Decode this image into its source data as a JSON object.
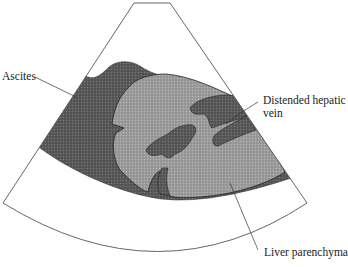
{
  "figure": {
    "type": "ultrasound-sector-schematic",
    "labels": {
      "ascites": "Ascites",
      "hepatic_vein_line1": "Distended hepatic",
      "hepatic_vein_line2": "vein",
      "liver": "Liver parenchyma"
    },
    "colors": {
      "background": "#ffffff",
      "outline": "#555555",
      "ascites_fill": "#5a5a5a",
      "liver_fill": "#9a9a9a",
      "vein_fill": "#5e5e5e",
      "text": "#222222"
    }
  }
}
